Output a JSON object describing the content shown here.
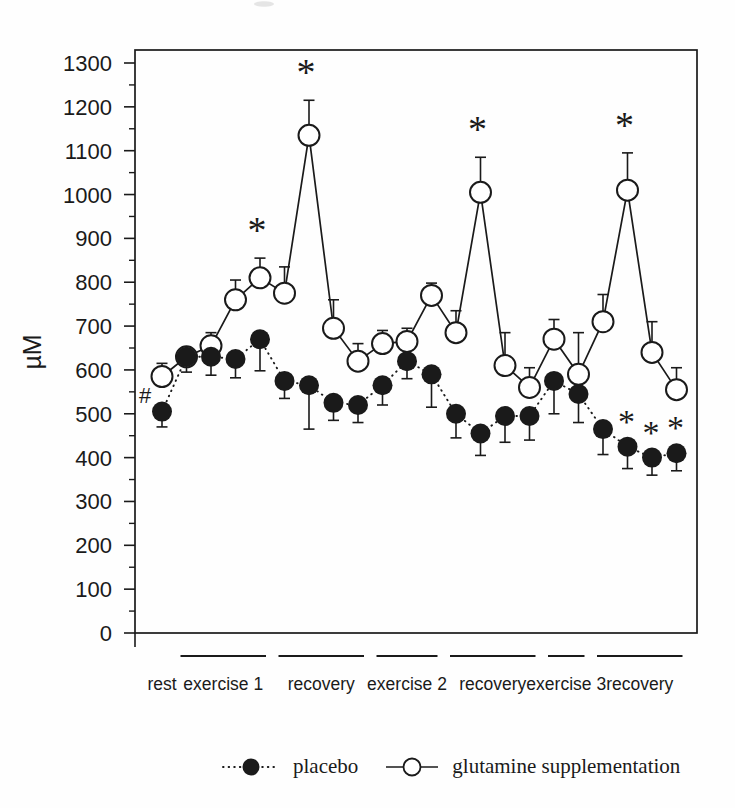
{
  "page": {
    "background": "#fefefe"
  },
  "colors": {
    "ink": "#1a1a1a",
    "paper": "#fefefe",
    "artifact": "#dcdcdc"
  },
  "chart_data": {
    "type": "line",
    "title": "",
    "xlabel": "",
    "ylabel": "µM",
    "ylim": [
      0,
      1300
    ],
    "yticks": [
      0,
      100,
      200,
      300,
      400,
      500,
      600,
      700,
      800,
      900,
      1000,
      1100,
      1200,
      1300
    ],
    "ytick_minor_step": 50,
    "grid": false,
    "legend_position": "bottom",
    "n_points": 22,
    "phases": [
      {
        "label": "rest",
        "from": 1,
        "to": 1,
        "bar": false
      },
      {
        "label": "exercise 1",
        "from": 2,
        "to": 5,
        "bar": true
      },
      {
        "label": "recovery",
        "from": 6,
        "to": 9,
        "bar": true
      },
      {
        "label": "exercise 2",
        "from": 10,
        "to": 12,
        "bar": true
      },
      {
        "label": "recovery",
        "from": 13,
        "to": 16,
        "bar": true
      },
      {
        "label": "exercise 3",
        "from": 17,
        "to": 18,
        "bar": true
      },
      {
        "label": "recovery",
        "from": 19,
        "to": 22,
        "bar": true
      }
    ],
    "series": [
      {
        "name": "placebo",
        "marker": "filled-circle",
        "line_style": "dotted",
        "error_bar_direction": "down",
        "values": [
          505,
          630,
          630,
          625,
          670,
          575,
          565,
          525,
          520,
          565,
          620,
          590,
          500,
          455,
          495,
          495,
          575,
          545,
          465,
          425,
          400,
          410
        ],
        "errors": [
          35,
          35,
          42,
          43,
          72,
          40,
          100,
          40,
          40,
          45,
          40,
          75,
          55,
          50,
          60,
          55,
          75,
          65,
          58,
          50,
          40,
          40
        ],
        "significant_points": [
          20,
          21,
          22
        ],
        "significance_symbol": "*"
      },
      {
        "name": "glutamine supplementation",
        "marker": "open-circle",
        "line_style": "solid",
        "error_bar_direction": "up",
        "values": [
          585,
          630,
          655,
          760,
          810,
          775,
          1135,
          695,
          620,
          660,
          665,
          770,
          685,
          1005,
          610,
          560,
          670,
          590,
          710,
          1010,
          640,
          555
        ],
        "errors": [
          30,
          20,
          30,
          45,
          45,
          60,
          80,
          65,
          40,
          30,
          30,
          28,
          50,
          80,
          75,
          45,
          45,
          95,
          62,
          85,
          70,
          50
        ],
        "significant_points": [
          5,
          7,
          14,
          20
        ],
        "significance_symbol": "*"
      }
    ],
    "annotations": [
      {
        "symbol": "#",
        "series": "placebo",
        "point": 1,
        "offset_x": -17,
        "offset_y": -17
      }
    ]
  }
}
